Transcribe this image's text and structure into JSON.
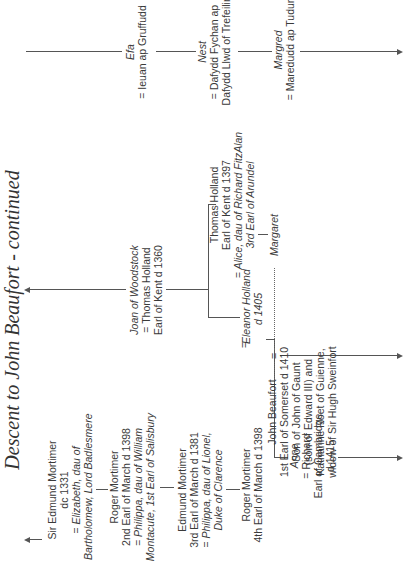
{
  "title": "Descent to John Beaufort - continued",
  "mortimer_line": {
    "sir_edmund": {
      "name": "Sir Edmund Mortimer",
      "detail": "dc 1331",
      "spouse_line1": "= Elizabeth, dau of",
      "spouse_line2": "Bartholomew, Lord Badlesmere"
    },
    "roger_2nd": {
      "name": "Roger Mortimer",
      "detail": "2nd Earl of March d 1398",
      "spouse_line1": "= Philippa, dau of William",
      "spouse_line2": "Montacute, 1st Earl of Salisbury"
    },
    "edmund_3rd": {
      "name": "Edmund Mortimer",
      "detail": "3rd Earl of March d 1381",
      "spouse_line1": "= Philippa, dau of Lionel,",
      "spouse_line2": "Duke of Clarence"
    },
    "roger_4th": {
      "name": "Roger Mortimer",
      "detail": "4th Earl of March d 1398",
      "marriage_sign": "="
    }
  },
  "holland_line": {
    "joan": {
      "name": "Joan of Woodstock",
      "spouse_line1": "= Thomas Holland",
      "spouse_line2": "Earl of Kent d 1360"
    },
    "eleanor": {
      "name": "Eleanor Holland",
      "detail": "d 1405"
    },
    "thomas": {
      "name": "Thomas Holland",
      "detail": "Earl of Kent d 1397",
      "spouse_line1": "= Alice, dau of Richard FitzAlan",
      "spouse_line2": "3rd Earl of Arundel"
    },
    "margaret": {
      "name": "Margaret"
    }
  },
  "anne": {
    "name": "Anne",
    "spouse_line1": "= Richard",
    "spouse_line2": "Earl of Cambridge",
    "spouse_line3": "d 1415"
  },
  "john_beaufort": {
    "name": "John Beaufort",
    "line1": "1st Earl of Somerset d 1410",
    "line2": "Son of John of Gaunt",
    "line3": "(son of Edward III) and",
    "line4": "Katharine Roet of Guienne,",
    "line5": "widow of Sir Hugh Sweinfort",
    "marriage_sign": "="
  },
  "welsh_line": {
    "efa": {
      "name": "Efa",
      "spouse": "= Ieuan ap Gruffudd"
    },
    "nest": {
      "name": "Nest",
      "spouse_line1": "= Dafydd Fychan ap",
      "spouse_line2": "Dafydd Llwd of Trefeilir"
    },
    "margred": {
      "name": "Margred",
      "spouse": "= Maredudd ap Tudur"
    }
  },
  "icons": {
    "line_arrow": "arrow-icon"
  }
}
